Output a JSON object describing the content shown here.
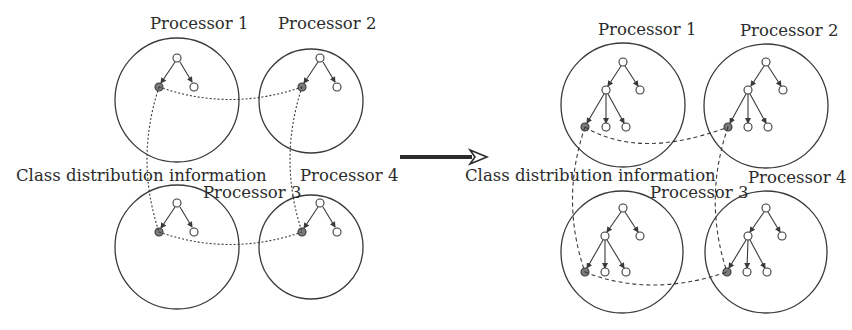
{
  "figure": {
    "left_panel": {
      "description": "Initial state: each processor holds a shallow tree; filled nodes share class distribution information",
      "center_label": "Class distribution information",
      "processors": [
        {
          "id": 1,
          "label": "Processor 1"
        },
        {
          "id": 2,
          "label": "Processor 2"
        },
        {
          "id": 3,
          "label": "Processor 3"
        },
        {
          "id": 4,
          "label": "Processor 4"
        }
      ],
      "link_style": "dotted"
    },
    "transition_arrow": {
      "direction": "right"
    },
    "right_panel": {
      "description": "Expanded state: each processor holds a deeper tree; filled leaf nodes share class distribution information",
      "center_label": "Class distribution information",
      "processors": [
        {
          "id": 1,
          "label": "Processor 1"
        },
        {
          "id": 2,
          "label": "Processor 2"
        },
        {
          "id": 3,
          "label": "Processor 3"
        },
        {
          "id": 4,
          "label": "Processor 4"
        }
      ],
      "link_style": "dashed"
    },
    "colors": {
      "stroke": "#3a3a3a",
      "text": "#2b2b2b",
      "filled_node": "#7a7a7a",
      "background": "#ffffff"
    }
  }
}
